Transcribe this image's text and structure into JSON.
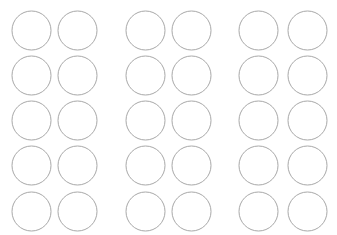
{
  "page": {
    "width": 337,
    "height": 235,
    "background_color": "#ffffff"
  },
  "style": {
    "circle_stroke_color": "#a8a8a8",
    "circle_fill_color": "none",
    "circle_stroke_width": 1,
    "circle_diameter": 39
  },
  "grid": {
    "columns": 6,
    "rows": 5,
    "total_circles": 30,
    "column_groups": 3,
    "columns_per_group": 2,
    "column_x": [
      12,
      58,
      126,
      172,
      239,
      288
    ],
    "row_y": [
      11,
      56,
      101,
      146,
      192
    ],
    "radius": 19.5
  },
  "circles": [
    {
      "id": "circle-r1-c1",
      "cx": 31.5,
      "cy": 30.5,
      "r": 19.5,
      "row": 1,
      "col": 1,
      "group": 1,
      "label": ""
    },
    {
      "id": "circle-r1-c2",
      "cx": 77.5,
      "cy": 30.5,
      "r": 19.5,
      "row": 1,
      "col": 2,
      "group": 1,
      "label": ""
    },
    {
      "id": "circle-r1-c3",
      "cx": 145.5,
      "cy": 30.5,
      "r": 19.5,
      "row": 1,
      "col": 3,
      "group": 2,
      "label": ""
    },
    {
      "id": "circle-r1-c4",
      "cx": 191.5,
      "cy": 30.5,
      "r": 19.5,
      "row": 1,
      "col": 4,
      "group": 2,
      "label": ""
    },
    {
      "id": "circle-r1-c5",
      "cx": 258.5,
      "cy": 30.5,
      "r": 19.5,
      "row": 1,
      "col": 5,
      "group": 3,
      "label": ""
    },
    {
      "id": "circle-r1-c6",
      "cx": 307.5,
      "cy": 30.5,
      "r": 19.5,
      "row": 1,
      "col": 6,
      "group": 3,
      "label": ""
    },
    {
      "id": "circle-r2-c1",
      "cx": 31.5,
      "cy": 75.5,
      "r": 19.5,
      "row": 2,
      "col": 1,
      "group": 1,
      "label": ""
    },
    {
      "id": "circle-r2-c2",
      "cx": 77.5,
      "cy": 75.5,
      "r": 19.5,
      "row": 2,
      "col": 2,
      "group": 1,
      "label": ""
    },
    {
      "id": "circle-r2-c3",
      "cx": 145.5,
      "cy": 75.5,
      "r": 19.5,
      "row": 2,
      "col": 3,
      "group": 2,
      "label": ""
    },
    {
      "id": "circle-r2-c4",
      "cx": 191.5,
      "cy": 75.5,
      "r": 19.5,
      "row": 2,
      "col": 4,
      "group": 2,
      "label": ""
    },
    {
      "id": "circle-r2-c5",
      "cx": 258.5,
      "cy": 75.5,
      "r": 19.5,
      "row": 2,
      "col": 5,
      "group": 3,
      "label": ""
    },
    {
      "id": "circle-r2-c6",
      "cx": 307.5,
      "cy": 75.5,
      "r": 19.5,
      "row": 2,
      "col": 6,
      "group": 3,
      "label": ""
    },
    {
      "id": "circle-r3-c1",
      "cx": 31.5,
      "cy": 120.5,
      "r": 19.5,
      "row": 3,
      "col": 1,
      "group": 1,
      "label": ""
    },
    {
      "id": "circle-r3-c2",
      "cx": 77.5,
      "cy": 120.5,
      "r": 19.5,
      "row": 3,
      "col": 2,
      "group": 1,
      "label": ""
    },
    {
      "id": "circle-r3-c3",
      "cx": 145.5,
      "cy": 120.5,
      "r": 19.5,
      "row": 3,
      "col": 3,
      "group": 2,
      "label": ""
    },
    {
      "id": "circle-r3-c4",
      "cx": 191.5,
      "cy": 120.5,
      "r": 19.5,
      "row": 3,
      "col": 4,
      "group": 2,
      "label": ""
    },
    {
      "id": "circle-r3-c5",
      "cx": 258.5,
      "cy": 120.5,
      "r": 19.5,
      "row": 3,
      "col": 5,
      "group": 3,
      "label": ""
    },
    {
      "id": "circle-r3-c6",
      "cx": 307.5,
      "cy": 120.5,
      "r": 19.5,
      "row": 3,
      "col": 6,
      "group": 3,
      "label": ""
    },
    {
      "id": "circle-r4-c1",
      "cx": 31.5,
      "cy": 165.5,
      "r": 19.5,
      "row": 4,
      "col": 1,
      "group": 1,
      "label": ""
    },
    {
      "id": "circle-r4-c2",
      "cx": 77.5,
      "cy": 165.5,
      "r": 19.5,
      "row": 4,
      "col": 2,
      "group": 1,
      "label": ""
    },
    {
      "id": "circle-r4-c3",
      "cx": 145.5,
      "cy": 165.5,
      "r": 19.5,
      "row": 4,
      "col": 3,
      "group": 2,
      "label": ""
    },
    {
      "id": "circle-r4-c4",
      "cx": 191.5,
      "cy": 165.5,
      "r": 19.5,
      "row": 4,
      "col": 4,
      "group": 2,
      "label": ""
    },
    {
      "id": "circle-r4-c5",
      "cx": 258.5,
      "cy": 165.5,
      "r": 19.5,
      "row": 4,
      "col": 5,
      "group": 3,
      "label": ""
    },
    {
      "id": "circle-r4-c6",
      "cx": 307.5,
      "cy": 165.5,
      "r": 19.5,
      "row": 4,
      "col": 6,
      "group": 3,
      "label": ""
    },
    {
      "id": "circle-r5-c1",
      "cx": 31.5,
      "cy": 211.5,
      "r": 19.5,
      "row": 5,
      "col": 1,
      "group": 1,
      "label": ""
    },
    {
      "id": "circle-r5-c2",
      "cx": 77.5,
      "cy": 211.5,
      "r": 19.5,
      "row": 5,
      "col": 2,
      "group": 1,
      "label": ""
    },
    {
      "id": "circle-r5-c3",
      "cx": 145.5,
      "cy": 211.5,
      "r": 19.5,
      "row": 5,
      "col": 3,
      "group": 2,
      "label": ""
    },
    {
      "id": "circle-r5-c4",
      "cx": 191.5,
      "cy": 211.5,
      "r": 19.5,
      "row": 5,
      "col": 4,
      "group": 2,
      "label": ""
    },
    {
      "id": "circle-r5-c5",
      "cx": 258.5,
      "cy": 211.5,
      "r": 19.5,
      "row": 5,
      "col": 5,
      "group": 3,
      "label": ""
    },
    {
      "id": "circle-r5-c6",
      "cx": 307.5,
      "cy": 211.5,
      "r": 19.5,
      "row": 5,
      "col": 6,
      "group": 3,
      "label": ""
    }
  ]
}
